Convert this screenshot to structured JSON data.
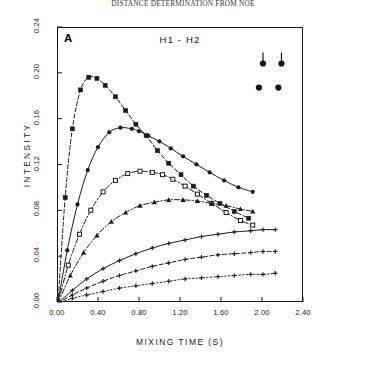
{
  "figure": {
    "running_head": "DISTANCE DETERMINATION FROM NOE",
    "panel_label": "A"
  },
  "chart_data": {
    "type": "line",
    "title": "H1 - H2",
    "xlabel": "MIXING TIME (S)",
    "ylabel": "INTENSITY",
    "xlim": [
      0.0,
      2.4
    ],
    "ylim": [
      0.0,
      0.24
    ],
    "xticks": [
      0.0,
      0.4,
      0.8,
      1.2,
      1.6,
      2.0,
      2.4
    ],
    "xtick_labels": [
      "0.00",
      "0.40",
      "0.80",
      "1.20",
      "1.60",
      "2.00",
      "2.40"
    ],
    "yticks": [
      0.0,
      0.04,
      0.08,
      0.12,
      0.16,
      0.2,
      0.24
    ],
    "ytick_labels": [
      "0.00",
      "0.04",
      "0.08",
      "0.12",
      "0.16",
      "0.20",
      "0.24"
    ],
    "grid": false,
    "legend": "none",
    "frame": "box",
    "series": [
      {
        "name": "curve-1",
        "marker": "square",
        "line_style": "dashed",
        "color": "#1a1a1a",
        "x": [
          0.0,
          0.07,
          0.14,
          0.22,
          0.3,
          0.38,
          0.46,
          0.56,
          0.66,
          0.76,
          0.86,
          0.97,
          1.08,
          1.2,
          1.32,
          1.45,
          1.58,
          1.72,
          1.86
        ],
        "y": [
          0.0,
          0.092,
          0.152,
          0.186,
          0.197,
          0.196,
          0.19,
          0.18,
          0.168,
          0.156,
          0.146,
          0.133,
          0.122,
          0.112,
          0.102,
          0.094,
          0.087,
          0.08,
          0.074
        ]
      },
      {
        "name": "curve-2",
        "marker": "circle",
        "line_style": "solid",
        "color": "#1a1a1a",
        "x": [
          0.0,
          0.09,
          0.19,
          0.29,
          0.39,
          0.5,
          0.61,
          0.72,
          0.79,
          0.88,
          0.99,
          1.1,
          1.22,
          1.35,
          1.48,
          1.62,
          1.76,
          1.9
        ],
        "y": [
          0.0,
          0.046,
          0.086,
          0.116,
          0.136,
          0.149,
          0.153,
          0.152,
          0.15,
          0.146,
          0.141,
          0.135,
          0.128,
          0.121,
          0.114,
          0.107,
          0.101,
          0.097
        ]
      },
      {
        "name": "curve-3",
        "marker": "square-open",
        "line_style": "dash-dot",
        "color": "#1a1a1a",
        "x": [
          0.0,
          0.1,
          0.21,
          0.32,
          0.44,
          0.56,
          0.68,
          0.8,
          0.92,
          1.02,
          1.12,
          1.24,
          1.36,
          1.5,
          1.64,
          1.78,
          1.9
        ],
        "y": [
          0.0,
          0.033,
          0.06,
          0.081,
          0.097,
          0.107,
          0.113,
          0.115,
          0.114,
          0.112,
          0.108,
          0.102,
          0.095,
          0.087,
          0.079,
          0.072,
          0.068
        ]
      },
      {
        "name": "curve-4",
        "marker": "triangle",
        "line_style": "dash-dot",
        "color": "#1a1a1a",
        "x": [
          0.0,
          0.12,
          0.25,
          0.38,
          0.52,
          0.66,
          0.8,
          0.94,
          1.08,
          1.22,
          1.36,
          1.5,
          1.64,
          1.78,
          1.9
        ],
        "y": [
          0.0,
          0.024,
          0.044,
          0.059,
          0.071,
          0.079,
          0.085,
          0.088,
          0.09,
          0.09,
          0.089,
          0.087,
          0.085,
          0.082,
          0.08
        ]
      },
      {
        "name": "curve-5",
        "marker": "plus",
        "line_style": "solid",
        "color": "#1a1a1a",
        "x": [
          0.0,
          0.14,
          0.28,
          0.44,
          0.6,
          0.76,
          0.92,
          1.08,
          1.24,
          1.4,
          1.56,
          1.72,
          1.88,
          2.0,
          2.12
        ],
        "y": [
          0.0,
          0.011,
          0.021,
          0.03,
          0.037,
          0.043,
          0.048,
          0.052,
          0.055,
          0.058,
          0.06,
          0.062,
          0.063,
          0.064,
          0.064
        ]
      },
      {
        "name": "curve-6",
        "marker": "plus",
        "line_style": "dashed",
        "color": "#1a1a1a",
        "x": [
          0.0,
          0.14,
          0.28,
          0.44,
          0.6,
          0.76,
          0.92,
          1.08,
          1.24,
          1.4,
          1.56,
          1.72,
          1.88,
          2.0,
          2.12
        ],
        "y": [
          0.0,
          0.007,
          0.013,
          0.019,
          0.024,
          0.028,
          0.032,
          0.035,
          0.038,
          0.04,
          0.042,
          0.043,
          0.044,
          0.045,
          0.045
        ]
      },
      {
        "name": "curve-7",
        "marker": "plus",
        "line_style": "dotted",
        "color": "#1a1a1a",
        "x": [
          0.0,
          0.14,
          0.28,
          0.44,
          0.6,
          0.76,
          0.92,
          1.08,
          1.24,
          1.4,
          1.56,
          1.72,
          1.88,
          2.0,
          2.12
        ],
        "y": [
          0.0,
          0.004,
          0.007,
          0.01,
          0.013,
          0.015,
          0.017,
          0.019,
          0.021,
          0.022,
          0.023,
          0.024,
          0.025,
          0.025,
          0.026
        ]
      }
    ],
    "annotation_markers": [
      {
        "name": "stem-dot-left",
        "x": 2.0,
        "y": 0.209,
        "style": "dot-with-stem"
      },
      {
        "name": "stem-dot-right",
        "x": 2.18,
        "y": 0.209,
        "style": "dot-with-stem"
      },
      {
        "name": "dot-left",
        "x": 1.96,
        "y": 0.188,
        "style": "dot"
      },
      {
        "name": "dot-right",
        "x": 2.15,
        "y": 0.188,
        "style": "dot"
      }
    ]
  }
}
